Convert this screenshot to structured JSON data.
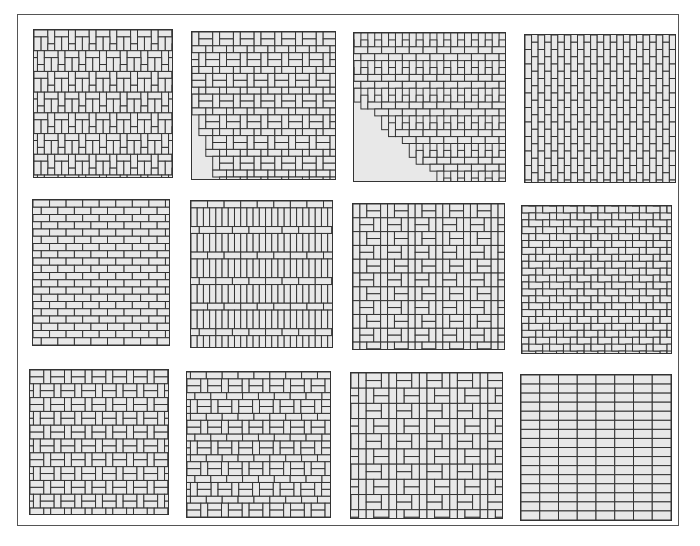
{
  "figure": {
    "title": "",
    "colors": {
      "brick_fill": "#e8e8e8",
      "joint_line": "#333333",
      "frame": "#555555",
      "background": "#ffffff"
    },
    "tiles": [
      {
        "id": "t1",
        "pattern": "pinwheel-basketweave",
        "x": 33,
        "y": 29,
        "w": 140,
        "h": 149
      },
      {
        "id": "t2",
        "pattern": "pinwheel-stack",
        "x": 191,
        "y": 31,
        "w": 145,
        "h": 149
      },
      {
        "id": "t3",
        "pattern": "herringbone-basketweave",
        "x": 353,
        "y": 32,
        "w": 153,
        "h": 150
      },
      {
        "id": "t4",
        "pattern": "vertical-running-bond",
        "x": 524,
        "y": 34,
        "w": 152,
        "h": 149
      },
      {
        "id": "t5",
        "pattern": "horizontal-running-bond",
        "x": 32,
        "y": 199,
        "w": 138,
        "h": 147
      },
      {
        "id": "t6",
        "pattern": "soldier-course-alternating",
        "x": 190,
        "y": 200,
        "w": 143,
        "h": 148
      },
      {
        "id": "t7",
        "pattern": "basketweave-offset",
        "x": 352,
        "y": 203,
        "w": 153,
        "h": 147
      },
      {
        "id": "t8",
        "pattern": "diagonal-herringbone",
        "x": 521,
        "y": 205,
        "w": 151,
        "h": 149
      },
      {
        "id": "t9",
        "pattern": "basketweave-half-bond",
        "x": 29,
        "y": 369,
        "w": 140,
        "h": 146
      },
      {
        "id": "t10",
        "pattern": "basketweave-with-courses",
        "x": 186,
        "y": 371,
        "w": 145,
        "h": 147
      },
      {
        "id": "t11",
        "pattern": "double-basketweave",
        "x": 350,
        "y": 372,
        "w": 153,
        "h": 147
      },
      {
        "id": "t12",
        "pattern": "stack-bond",
        "x": 520,
        "y": 374,
        "w": 152,
        "h": 147
      }
    ]
  }
}
